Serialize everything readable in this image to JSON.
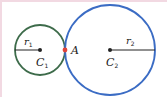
{
  "diagram": {
    "type": "tangent-circles",
    "colors": {
      "circle1": "#3d6b4a",
      "circle2": "#3b6cc4",
      "tangent_point": "#e0443a",
      "center": "#222222",
      "border": "#f2d9e2"
    },
    "circle1": {
      "center_label": "C",
      "center_sub": "1",
      "radius_label": "r",
      "radius_sub": "1"
    },
    "circle2": {
      "center_label": "C",
      "center_sub": "2",
      "radius_label": "r",
      "radius_sub": "2"
    },
    "tangent_point": {
      "label": "A"
    }
  }
}
